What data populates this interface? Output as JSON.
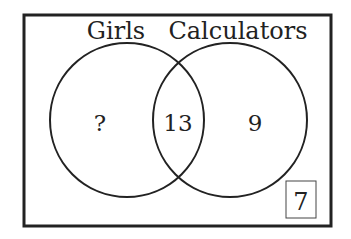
{
  "diagram": {
    "type": "venn",
    "sets": [
      {
        "label": "Girls",
        "only_value": "?"
      },
      {
        "label": "Calculators",
        "only_value": "9"
      }
    ],
    "intersection_value": "13",
    "outside_value": "7",
    "colors": {
      "stroke": "#222222",
      "background": "#ffffff",
      "text": "#222222"
    }
  }
}
